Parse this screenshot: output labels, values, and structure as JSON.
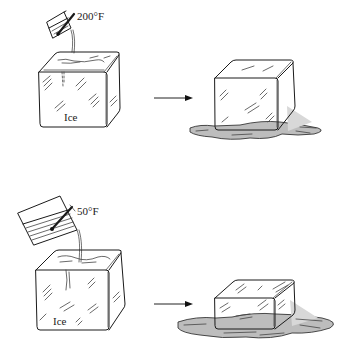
{
  "figure": {
    "top_panel": {
      "water_temperature_label": "200°F",
      "block_label": "Ice",
      "description": "Hot water poured from a small beaker with thermometer onto a large ice block; result is a slightly smaller ice block in a puddle"
    },
    "bottom_panel": {
      "water_temperature_label": "50°F",
      "block_label": "Ice",
      "description": "Larger volume of cool water poured from a large beaker with thermometer onto a large ice block; result is a much smaller ice block in a larger puddle"
    },
    "arrow_symbol": "→",
    "colors": {
      "ink": "#1a1a1a",
      "background": "#ffffff",
      "puddle_shade": "#bdbdbd"
    }
  }
}
